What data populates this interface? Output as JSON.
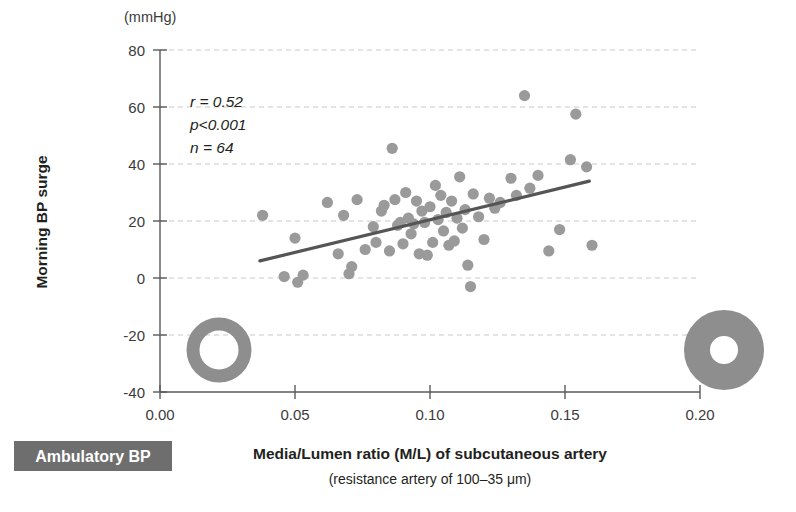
{
  "figure": {
    "unit_label": "(mmHg)",
    "badge_label": "Ambulatory BP",
    "badge_color": "#6e6e6e",
    "marker_color": "#9a9a9a",
    "regression_color": "#555555",
    "grid_color": "#c9c9c9"
  },
  "annotations": {
    "r": "r = 0.52",
    "p": "p<0.001",
    "n": "n = 64"
  },
  "icons": {
    "left_vessel_label": "thin-wall-vessel-ring",
    "right_vessel_label": "thick-wall-vessel-ring"
  },
  "chart_data": {
    "type": "scatter",
    "title": "",
    "xlabel": "Media/Lumen ratio (M/L) of subcutaneous artery",
    "xlabel_sub": "(resistance artery of 100–35 μm)",
    "ylabel": "Morning BP surge",
    "yunit": "(mmHg)",
    "xlim": [
      0.0,
      0.2
    ],
    "ylim": [
      -40,
      80
    ],
    "xticks": [
      0.0,
      0.05,
      0.1,
      0.15,
      0.2
    ],
    "xtick_labels": [
      "0.00",
      "0.05",
      "0.10",
      "0.15",
      "0.20"
    ],
    "yticks": [
      -40,
      -20,
      0,
      20,
      40,
      60,
      80
    ],
    "ytick_labels": [
      "-40",
      "-20",
      "0",
      "20",
      "40",
      "60",
      "80"
    ],
    "grid": "horizontal-dashed",
    "legend": "none",
    "stats": {
      "r": 0.52,
      "p": "<0.001",
      "n": 64
    },
    "regression_line": {
      "x": [
        0.037,
        0.159
      ],
      "y": [
        6.0,
        34.0
      ]
    },
    "points": [
      {
        "x": 0.038,
        "y": 22.0
      },
      {
        "x": 0.046,
        "y": 0.5
      },
      {
        "x": 0.05,
        "y": 14.0
      },
      {
        "x": 0.051,
        "y": -1.5
      },
      {
        "x": 0.053,
        "y": 1.0
      },
      {
        "x": 0.062,
        "y": 26.5
      },
      {
        "x": 0.066,
        "y": 8.5
      },
      {
        "x": 0.068,
        "y": 22.0
      },
      {
        "x": 0.07,
        "y": 1.5
      },
      {
        "x": 0.071,
        "y": 4.0
      },
      {
        "x": 0.073,
        "y": 27.5
      },
      {
        "x": 0.076,
        "y": 10.0
      },
      {
        "x": 0.079,
        "y": 18.0
      },
      {
        "x": 0.08,
        "y": 12.5
      },
      {
        "x": 0.082,
        "y": 23.5
      },
      {
        "x": 0.083,
        "y": 25.5
      },
      {
        "x": 0.085,
        "y": 9.5
      },
      {
        "x": 0.086,
        "y": 45.5
      },
      {
        "x": 0.087,
        "y": 27.5
      },
      {
        "x": 0.088,
        "y": 18.5
      },
      {
        "x": 0.089,
        "y": 19.5
      },
      {
        "x": 0.09,
        "y": 12.0
      },
      {
        "x": 0.091,
        "y": 30.0
      },
      {
        "x": 0.092,
        "y": 21.0
      },
      {
        "x": 0.093,
        "y": 15.5
      },
      {
        "x": 0.094,
        "y": 19.0
      },
      {
        "x": 0.095,
        "y": 27.0
      },
      {
        "x": 0.096,
        "y": 8.5
      },
      {
        "x": 0.097,
        "y": 23.5
      },
      {
        "x": 0.098,
        "y": 19.5
      },
      {
        "x": 0.099,
        "y": 8.0
      },
      {
        "x": 0.1,
        "y": 25.0
      },
      {
        "x": 0.101,
        "y": 12.5
      },
      {
        "x": 0.102,
        "y": 32.5
      },
      {
        "x": 0.103,
        "y": 20.5
      },
      {
        "x": 0.104,
        "y": 29.0
      },
      {
        "x": 0.105,
        "y": 16.5
      },
      {
        "x": 0.106,
        "y": 23.0
      },
      {
        "x": 0.107,
        "y": 11.5
      },
      {
        "x": 0.108,
        "y": 27.0
      },
      {
        "x": 0.109,
        "y": 13.0
      },
      {
        "x": 0.11,
        "y": 21.0
      },
      {
        "x": 0.111,
        "y": 35.5
      },
      {
        "x": 0.112,
        "y": 17.5
      },
      {
        "x": 0.113,
        "y": 24.0
      },
      {
        "x": 0.114,
        "y": 4.5
      },
      {
        "x": 0.115,
        "y": -3.0
      },
      {
        "x": 0.116,
        "y": 29.5
      },
      {
        "x": 0.118,
        "y": 21.5
      },
      {
        "x": 0.12,
        "y": 13.5
      },
      {
        "x": 0.122,
        "y": 28.0
      },
      {
        "x": 0.124,
        "y": 24.5
      },
      {
        "x": 0.126,
        "y": 26.5
      },
      {
        "x": 0.13,
        "y": 35.0
      },
      {
        "x": 0.132,
        "y": 29.0
      },
      {
        "x": 0.135,
        "y": 64.0
      },
      {
        "x": 0.137,
        "y": 31.5
      },
      {
        "x": 0.14,
        "y": 36.0
      },
      {
        "x": 0.144,
        "y": 9.5
      },
      {
        "x": 0.148,
        "y": 17.0
      },
      {
        "x": 0.152,
        "y": 41.5
      },
      {
        "x": 0.154,
        "y": 57.5
      },
      {
        "x": 0.158,
        "y": 39.0
      },
      {
        "x": 0.16,
        "y": 11.5
      }
    ]
  }
}
